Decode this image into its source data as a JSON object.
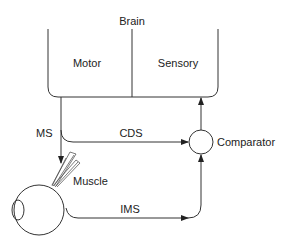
{
  "diagram": {
    "brain": {
      "title": "Brain",
      "motor_label": "Motor",
      "sensory_label": "Sensory"
    },
    "signals": {
      "ms_label": "MS",
      "cds_label": "CDS",
      "ims_label": "IMS"
    },
    "comparator_label": "Comparator",
    "muscle_label": "Muscle",
    "colors": {
      "line": "#333333",
      "text": "#222222",
      "background": "#ffffff"
    }
  }
}
